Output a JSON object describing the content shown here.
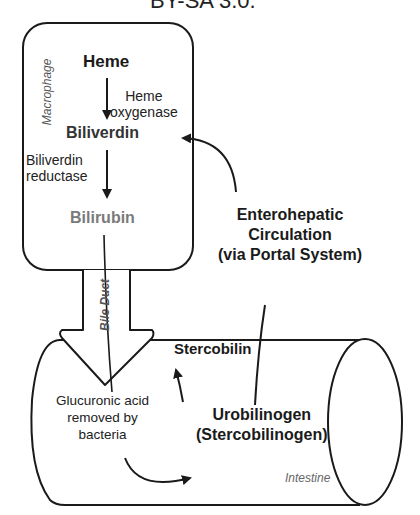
{
  "header": {
    "license_fragment": "BY-SA 3.0."
  },
  "compartments": {
    "macrophage": "Macrophage",
    "bile_duct": "Bile Duct",
    "intestine": "Intestine"
  },
  "molecules": {
    "heme": "Heme",
    "biliverdin": "Biliverdin",
    "bilirubin": "Bilirubin",
    "stercobilin": "Stercobilin",
    "urobilinogen_line1": "Urobilinogen",
    "urobilinogen_line2": "(Stercobilinogen)"
  },
  "enzymes": {
    "heme_oxygenase_line1": "Heme",
    "heme_oxygenase_line2": "oxygenase",
    "biliverdin_reductase_line1": "Biliverdin",
    "biliverdin_reductase_line2": "reductase"
  },
  "annotations": {
    "glucuronic_line1": "Glucuronic acid",
    "glucuronic_line2": "removed by",
    "glucuronic_line3": "bacteria",
    "entero_line1": "Enterohepatic",
    "entero_line2": "Circulation",
    "entero_line3": "(via Portal System)"
  },
  "colors": {
    "stroke": "#1a1a1a",
    "bilirubin_text": "#7a7a7a",
    "biliverdin_text": "#333333"
  }
}
